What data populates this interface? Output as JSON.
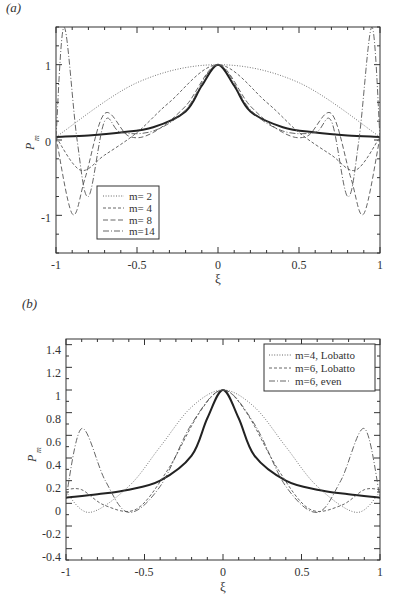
{
  "chart_data": [
    {
      "panel_label": "(a)",
      "type": "line",
      "title": "",
      "xlabel": "ξ",
      "ylabel": "P_m",
      "xlim": [
        -1,
        1
      ],
      "ylim": [
        -1.5,
        1.5
      ],
      "xticks": [
        "-1",
        "-0.5",
        "0",
        "0.5",
        "1"
      ],
      "yticks": [
        "-1",
        "0",
        "1"
      ],
      "legend_position": "lower-left",
      "series": [
        {
          "name": "target",
          "style": "solid-thick",
          "x": [
            -1,
            -0.8,
            -0.6,
            -0.4,
            -0.2,
            -0.1,
            0,
            0.1,
            0.2,
            0.4,
            0.6,
            0.8,
            1
          ],
          "y": [
            0.04,
            0.06,
            0.1,
            0.17,
            0.38,
            0.72,
            1,
            0.72,
            0.38,
            0.17,
            0.1,
            0.06,
            0.04
          ]
        },
        {
          "name": "m= 2",
          "style": "dotted",
          "x": [
            -1,
            -0.5,
            0,
            0.5,
            1
          ],
          "y": [
            0.04,
            0.76,
            1,
            0.76,
            0.04
          ]
        },
        {
          "name": "m= 4",
          "style": "dashed",
          "x": [
            -1,
            -0.85,
            -0.7,
            -0.5,
            -0.3,
            0,
            0.3,
            0.5,
            0.7,
            0.85,
            1
          ],
          "y": [
            0.04,
            -0.4,
            -0.2,
            0.1,
            0.5,
            1,
            0.5,
            0.1,
            -0.2,
            -0.4,
            0.04
          ]
        },
        {
          "name": "m= 8",
          "style": "long-dashed",
          "x": [
            -1,
            -0.9,
            -0.82,
            -0.7,
            -0.55,
            -0.4,
            -0.2,
            0,
            0.2,
            0.4,
            0.55,
            0.7,
            0.82,
            0.9,
            1
          ],
          "y": [
            0.04,
            -0.98,
            -0.5,
            0.35,
            0.05,
            0.1,
            0.45,
            1,
            0.45,
            0.1,
            0.05,
            0.35,
            -0.5,
            -0.98,
            0.04
          ]
        },
        {
          "name": "m=14",
          "style": "dash-dot",
          "x": [
            -1,
            -0.95,
            -0.87,
            -0.8,
            -0.7,
            -0.6,
            -0.4,
            -0.2,
            0,
            0.2,
            0.4,
            0.6,
            0.7,
            0.8,
            0.87,
            0.95,
            1
          ],
          "y": [
            0.04,
            1.5,
            0,
            -0.75,
            0.25,
            0.1,
            0.12,
            0.4,
            1,
            0.4,
            0.12,
            0.1,
            0.25,
            -0.75,
            0,
            1.5,
            0.04
          ]
        }
      ]
    },
    {
      "panel_label": "(b)",
      "type": "line",
      "title": "",
      "xlabel": "ξ",
      "ylabel": "P_m",
      "xlim": [
        -1,
        1
      ],
      "ylim": [
        -0.5,
        1.45
      ],
      "xticks": [
        "-1",
        "-0.5",
        "0",
        "0.5",
        "1"
      ],
      "yticks": [
        "-0.4",
        "-0.2",
        "0",
        "0.2",
        "0.4",
        "0.6",
        "0.8",
        "1",
        "1.2",
        "1.4"
      ],
      "legend_position": "upper-right",
      "series": [
        {
          "name": "target",
          "style": "solid-thick",
          "x": [
            -1,
            -0.8,
            -0.6,
            -0.4,
            -0.2,
            -0.1,
            0,
            0.1,
            0.2,
            0.4,
            0.6,
            0.8,
            1
          ],
          "y": [
            0.05,
            0.08,
            0.12,
            0.2,
            0.42,
            0.75,
            1,
            0.75,
            0.42,
            0.2,
            0.12,
            0.08,
            0.05
          ]
        },
        {
          "name": "m=4, Lobatto",
          "style": "dotted",
          "x": [
            -1,
            -0.85,
            -0.6,
            -0.4,
            -0.2,
            0,
            0.2,
            0.4,
            0.6,
            0.85,
            1
          ],
          "y": [
            0.1,
            -0.08,
            0.15,
            0.5,
            0.85,
            1,
            0.85,
            0.5,
            0.15,
            -0.08,
            0.1
          ]
        },
        {
          "name": "m=6, Lobatto",
          "style": "dashed",
          "x": [
            -1,
            -0.9,
            -0.75,
            -0.55,
            -0.35,
            -0.15,
            0,
            0.15,
            0.35,
            0.55,
            0.75,
            0.9,
            1
          ],
          "y": [
            0.12,
            0.12,
            -0.02,
            -0.05,
            0.3,
            0.8,
            1,
            0.8,
            0.3,
            -0.05,
            -0.02,
            0.12,
            0.12
          ]
        },
        {
          "name": "m=6, even",
          "style": "dash-dot",
          "x": [
            -1,
            -0.9,
            -0.75,
            -0.6,
            -0.4,
            -0.2,
            0,
            0.2,
            0.4,
            0.6,
            0.75,
            0.9,
            1
          ],
          "y": [
            0.05,
            0.66,
            0.2,
            -0.08,
            0.15,
            0.7,
            1,
            0.7,
            0.15,
            -0.08,
            0.2,
            0.66,
            0.05
          ]
        }
      ]
    }
  ],
  "panels": {
    "a": {
      "label": "(a)",
      "xlabel": "ξ",
      "ylabel": "P",
      "ylabel_sub": "m",
      "xticks": [
        "-1",
        "-0.5",
        "0",
        "0.5",
        "1"
      ],
      "yticks": [
        "1",
        "0",
        "-1"
      ],
      "legend": [
        "m= 2",
        "m= 4",
        "m= 8",
        "m=14"
      ]
    },
    "b": {
      "label": "(b)",
      "xlabel": "ξ",
      "ylabel": "P",
      "ylabel_sub": "m",
      "xticks": [
        "-1",
        "-0.5",
        "0",
        "0.5",
        "1"
      ],
      "yticks": [
        "1.4",
        "1.2",
        "1",
        "0.8",
        "0.6",
        "0.4",
        "0.2",
        "0",
        "-0.2",
        "-0.4"
      ],
      "legend": [
        "m=4, Lobatto",
        "m=6, Lobatto",
        "m=6, even"
      ]
    }
  }
}
